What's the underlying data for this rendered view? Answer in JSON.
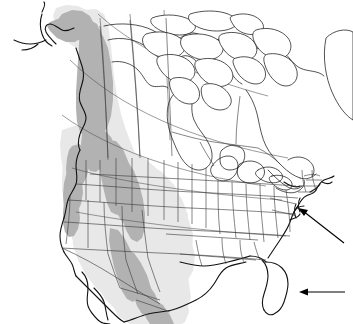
{
  "figure": {
    "kind": "distribution-map",
    "region": "North America",
    "background_color": "#ffffff",
    "width": 353,
    "height": 324,
    "title": "",
    "caption": ""
  },
  "legend": {
    "present": false,
    "entries": [
      {
        "name": "core-range",
        "label": "",
        "color": "#b2b2b2"
      },
      {
        "name": "broad-range",
        "label": "",
        "color": "#e6e6e6"
      },
      {
        "name": "absent",
        "label": "",
        "color": "#ffffff"
      }
    ]
  },
  "colors": {
    "range_dark": "#b2b2b2",
    "range_mid": "#cccccc",
    "range_light": "#e8e8e8",
    "land": "#ffffff",
    "coastline": "#1a1a1a",
    "admin_border": "#3a3a3a",
    "graticule": "#4a4a4a",
    "arrow": "#000000"
  },
  "annotations": {
    "arrows": [
      {
        "name": "arrow-mid-atlantic",
        "label": "",
        "direction": "up-left",
        "tail": {
          "x": 344,
          "y": 243
        },
        "tip": {
          "x": 298,
          "y": 208
        }
      },
      {
        "name": "arrow-florida",
        "label": "",
        "direction": "left",
        "tail": {
          "x": 345,
          "y": 292
        },
        "tip": {
          "x": 300,
          "y": 292
        }
      }
    ]
  },
  "map_features": {
    "graticule_lines": 7,
    "shaded_bands": 2,
    "admin_boundaries": "US states and Canadian provinces",
    "arctic_islands": "Canadian Arctic Archipelago outlined, unshaded"
  }
}
